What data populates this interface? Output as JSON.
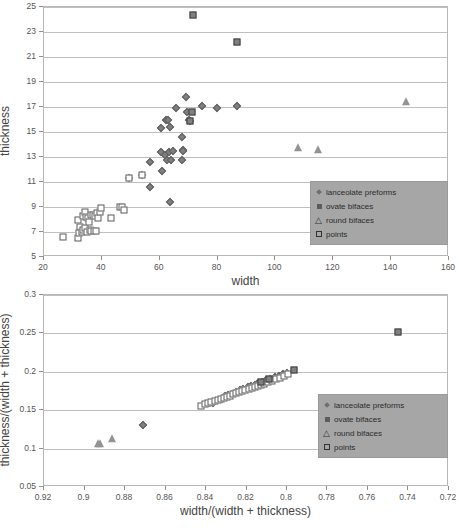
{
  "chart_data": [
    {
      "id": "top",
      "type": "scatter",
      "title": "",
      "xlabel": "width",
      "ylabel": "thickness",
      "xlim": [
        20,
        160
      ],
      "ylim": [
        5,
        25
      ],
      "xticks": [
        20,
        40,
        60,
        80,
        100,
        120,
        140,
        160
      ],
      "yticks": [
        5,
        7,
        9,
        11,
        13,
        15,
        17,
        19,
        21,
        23,
        25
      ],
      "grid": "horizontal",
      "legend_position": "bottom-right",
      "series": [
        {
          "name": "lanceolate preforms",
          "marker": "diamond",
          "color": "#7f7f7f",
          "points": [
            [
              49.5,
              11.3
            ],
            [
              53.8,
              11.6
            ],
            [
              56.5,
              12.6
            ],
            [
              56.8,
              10.6
            ],
            [
              60.3,
              15.3
            ],
            [
              60.5,
              13.4
            ],
            [
              60.8,
              11.9
            ],
            [
              61.8,
              13.2
            ],
            [
              62.2,
              16.0
            ],
            [
              62.6,
              12.8
            ],
            [
              63.0,
              16.0
            ],
            [
              63.2,
              13.4
            ],
            [
              63.4,
              9.4
            ],
            [
              63.5,
              15.4
            ],
            [
              64.0,
              12.8
            ],
            [
              64.5,
              13.5
            ],
            [
              65.8,
              16.9
            ],
            [
              67.6,
              12.8
            ],
            [
              67.8,
              14.6
            ],
            [
              68.0,
              13.6
            ],
            [
              68.2,
              13.5
            ],
            [
              69.0,
              17.8
            ],
            [
              69.6,
              16.6
            ],
            [
              70.2,
              16.0
            ],
            [
              70.4,
              15.9
            ],
            [
              74.5,
              17.1
            ],
            [
              79.8,
              16.9
            ],
            [
              86.8,
              17.1
            ]
          ]
        },
        {
          "name": "ovate bifaces",
          "marker": "filled-square",
          "color": "#808080",
          "points": [
            [
              71.5,
              24.4
            ],
            [
              86.6,
              22.2
            ],
            [
              71.2,
              16.6
            ],
            [
              70.6,
              15.9
            ]
          ]
        },
        {
          "name": "round bifaces",
          "marker": "triangle",
          "color": "#939393",
          "points": [
            [
              107.8,
              13.7
            ],
            [
              114.8,
              13.6
            ],
            [
              145.0,
              17.4
            ]
          ]
        },
        {
          "name": "points",
          "marker": "open-square",
          "color": "#ffffff",
          "points": [
            [
              26.6,
              6.6
            ],
            [
              31.6,
              6.5
            ],
            [
              31.8,
              8.0
            ],
            [
              32.0,
              6.9
            ],
            [
              32.6,
              7.4
            ],
            [
              33.0,
              7.0
            ],
            [
              33.4,
              8.3
            ],
            [
              33.6,
              7.2
            ],
            [
              34.0,
              8.6
            ],
            [
              34.2,
              7.3
            ],
            [
              34.6,
              8.2
            ],
            [
              35.0,
              7.0
            ],
            [
              35.2,
              8.1
            ],
            [
              35.6,
              7.8
            ],
            [
              35.8,
              7.2
            ],
            [
              36.2,
              8.4
            ],
            [
              36.4,
              7.1
            ],
            [
              36.8,
              8.4
            ],
            [
              37.2,
              7.1
            ],
            [
              37.6,
              8.3
            ],
            [
              38.0,
              7.1
            ],
            [
              38.4,
              8.5
            ],
            [
              38.8,
              8.1
            ],
            [
              39.4,
              8.6
            ],
            [
              39.8,
              8.9
            ],
            [
              43.0,
              8.1
            ],
            [
              46.2,
              9.0
            ],
            [
              46.8,
              9.0
            ],
            [
              47.6,
              8.8
            ],
            [
              53.8,
              11.6
            ],
            [
              49.5,
              11.3
            ]
          ]
        }
      ]
    },
    {
      "id": "bottom",
      "type": "scatter",
      "title": "",
      "xlabel": "width/(width + thickness)",
      "ylabel": "thickness/(width + thickness)",
      "xlim": [
        0.92,
        0.72
      ],
      "ylim": [
        0.05,
        0.3
      ],
      "x_reversed": true,
      "xticks": [
        0.92,
        0.9,
        0.88,
        0.86,
        0.84,
        0.82,
        0.8,
        0.78,
        0.76,
        0.74,
        0.72
      ],
      "yticks": [
        0.05,
        0.1,
        0.15,
        0.2,
        0.25,
        0.3
      ],
      "xtick_labels": [
        "0.92",
        "0.9",
        "0.88",
        "0.86",
        "0.84",
        "0.82",
        "0.8",
        "0.78",
        "0.76",
        "0.74",
        "0.72"
      ],
      "ytick_labels": [
        "0.05",
        "0.1",
        "0.15",
        "0.2",
        "0.25",
        "0.3"
      ],
      "grid": "horizontal",
      "legend_position": "bottom-right",
      "series": [
        {
          "name": "lanceolate preforms",
          "marker": "diamond",
          "color": "#7f7f7f",
          "points": [
            [
              0.871,
              0.131
            ],
            [
              0.8385,
              0.159
            ],
            [
              0.8365,
              0.16
            ],
            [
              0.832,
              0.165
            ],
            [
              0.8305,
              0.168
            ],
            [
              0.829,
              0.17
            ],
            [
              0.827,
              0.1715
            ],
            [
              0.825,
              0.174
            ],
            [
              0.823,
              0.176
            ],
            [
              0.8215,
              0.178
            ],
            [
              0.8195,
              0.18
            ],
            [
              0.818,
              0.1815
            ],
            [
              0.816,
              0.183
            ],
            [
              0.8145,
              0.185
            ],
            [
              0.8125,
              0.187
            ],
            [
              0.8105,
              0.189
            ],
            [
              0.8085,
              0.1905
            ],
            [
              0.806,
              0.193
            ],
            [
              0.804,
              0.195
            ],
            [
              0.802,
              0.197
            ],
            [
              0.8,
              0.199
            ]
          ]
        },
        {
          "name": "ovate bifaces",
          "marker": "filled-square",
          "color": "#808080",
          "points": [
            [
              0.745,
              0.252
            ],
            [
              0.7965,
              0.2025
            ],
            [
              0.809,
              0.19
            ],
            [
              0.813,
              0.1865
            ]
          ]
        },
        {
          "name": "round bifaces",
          "marker": "triangle",
          "color": "#939393",
          "points": [
            [
              0.8935,
              0.1055
            ],
            [
              0.8865,
              0.1125
            ],
            [
              0.8925,
              0.106
            ]
          ]
        },
        {
          "name": "points",
          "marker": "open-square",
          "color": "#ffffff",
          "points": [
            [
              0.8425,
              0.1555
            ],
            [
              0.8405,
              0.158
            ],
            [
              0.839,
              0.1595
            ],
            [
              0.8375,
              0.1605
            ],
            [
              0.8355,
              0.1615
            ],
            [
              0.834,
              0.163
            ],
            [
              0.8325,
              0.1645
            ],
            [
              0.831,
              0.166
            ],
            [
              0.8295,
              0.1675
            ],
            [
              0.828,
              0.169
            ],
            [
              0.8265,
              0.1705
            ],
            [
              0.825,
              0.172
            ],
            [
              0.8235,
              0.1735
            ],
            [
              0.822,
              0.1745
            ],
            [
              0.8205,
              0.176
            ],
            [
              0.819,
              0.1775
            ],
            [
              0.8175,
              0.179
            ],
            [
              0.816,
              0.18
            ],
            [
              0.8145,
              0.1815
            ],
            [
              0.813,
              0.183
            ],
            [
              0.8115,
              0.1845
            ],
            [
              0.8095,
              0.1865
            ],
            [
              0.8075,
              0.1885
            ],
            [
              0.8055,
              0.1905
            ],
            [
              0.8035,
              0.1925
            ],
            [
              0.8015,
              0.195
            ],
            [
              0.7995,
              0.1975
            ]
          ]
        }
      ]
    }
  ],
  "legend": {
    "items": [
      {
        "label": "lanceolate preforms",
        "marker": "diamond"
      },
      {
        "label": "ovate bifaces",
        "marker": "filled-square"
      },
      {
        "label": "round bifaces",
        "marker": "triangle"
      },
      {
        "label": "points",
        "marker": "open-square"
      }
    ]
  },
  "colors": {
    "grid": "#bfbfbf",
    "frame": "#b7b7b7",
    "text": "#4a4a4a",
    "marker_fill": "#7f7f7f",
    "marker_edge": "#3f3f3f",
    "legend_bg": "#a6a6a6"
  }
}
